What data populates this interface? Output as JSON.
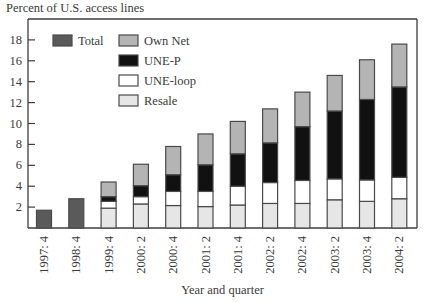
{
  "chart_data": {
    "type": "bar",
    "stacked": true,
    "title": "",
    "ylabel": "Percent of U.S. access lines",
    "xlabel": "Year and quarter",
    "ylim": [
      0,
      20
    ],
    "yticks": [
      2,
      4,
      6,
      8,
      10,
      12,
      14,
      16,
      18
    ],
    "grid": false,
    "legend_position": "top-left",
    "categories": [
      "1997: 4",
      "1998: 4",
      "1999: 4",
      "2000: 2",
      "2000: 4",
      "2001: 2",
      "2001: 4",
      "2002: 2",
      "2002: 4",
      "2003: 2",
      "2003: 4",
      "2004: 2"
    ],
    "series": [
      {
        "name": "Total",
        "color": "#5a5a5a",
        "values": [
          1.7,
          2.8,
          null,
          null,
          null,
          null,
          null,
          null,
          null,
          null,
          null,
          null
        ]
      },
      {
        "name": "Resale",
        "color": "#e6e6e6",
        "values": [
          null,
          null,
          1.9,
          2.3,
          2.15,
          2.05,
          2.2,
          2.35,
          2.35,
          2.7,
          2.55,
          2.8
        ]
      },
      {
        "name": "UNE-loop",
        "color": "#ffffff",
        "values": [
          null,
          null,
          0.65,
          0.7,
          1.35,
          1.45,
          1.8,
          2.0,
          2.2,
          2.0,
          2.05,
          2.05
        ]
      },
      {
        "name": "UNE-P",
        "color": "#111111",
        "values": [
          null,
          null,
          0.45,
          1.05,
          1.6,
          2.55,
          3.1,
          3.8,
          5.15,
          6.5,
          7.7,
          8.65
        ]
      },
      {
        "name": "Own Net",
        "color": "#b4b4b4",
        "values": [
          null,
          null,
          1.4,
          2.05,
          2.7,
          2.95,
          3.1,
          3.25,
          3.3,
          3.4,
          3.8,
          4.1
        ]
      }
    ],
    "legend": [
      {
        "name": "Total",
        "color": "#5a5a5a"
      },
      {
        "name": "Own Net",
        "color": "#b4b4b4"
      },
      {
        "name": "UNE-P",
        "color": "#111111"
      },
      {
        "name": "UNE-loop",
        "color": "#ffffff"
      },
      {
        "name": "Resale",
        "color": "#e6e6e6"
      }
    ]
  }
}
